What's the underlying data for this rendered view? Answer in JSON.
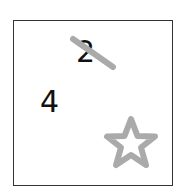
{
  "card": {
    "numbers": [
      {
        "value": "2",
        "struck_out": true
      },
      {
        "value": "4",
        "struck_out": false
      }
    ],
    "strike_color": "#aaaaaa",
    "star": {
      "icon": "star-outline-icon",
      "color": "#aaaaaa"
    },
    "border_color": "#333333"
  }
}
